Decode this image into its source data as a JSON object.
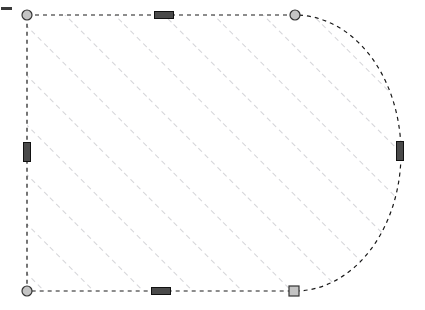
{
  "canvas": {
    "width": 425,
    "height": 310,
    "background_color": "#ffffff",
    "label": "drawing-canvas"
  },
  "shape": {
    "name": "hatched-rounded-end-rectangle",
    "description": "Rectangle with semicircular right end, selected",
    "state": "selected",
    "outline": {
      "color": "#1a1a1a",
      "style": "dashed",
      "dash_pattern": "4 4",
      "width": 1.2
    },
    "geometry": {
      "left_x": 27,
      "right_x": 295,
      "top_y": 15,
      "bottom_y": 291,
      "arc_peak_x": 401,
      "arc_center_y": 153
    },
    "fill": {
      "type": "hatch",
      "pattern": "diagonal-dashed-45",
      "color": "#a8a8b0",
      "spacing": 35,
      "angle_degrees": 45,
      "dash_pattern": "5 4",
      "width": 1
    }
  },
  "handles": {
    "corner_grips": [
      {
        "name": "grip-top-left",
        "shape": "circle",
        "x": 27,
        "y": 15
      },
      {
        "name": "grip-top-right",
        "shape": "circle",
        "x": 295,
        "y": 15
      },
      {
        "name": "grip-bottom-left",
        "shape": "circle",
        "x": 27,
        "y": 291
      },
      {
        "name": "grip-bottom-right",
        "shape": "square",
        "x": 294,
        "y": 291
      }
    ],
    "grip_style": {
      "fill_color": "#c4c4c4",
      "border_color": "#333333",
      "radius": 5,
      "square_size": 10
    },
    "edge_grips": [
      {
        "name": "grip-top-mid",
        "orientation": "horizontal",
        "x": 164,
        "y": 15
      },
      {
        "name": "grip-bottom-mid",
        "orientation": "horizontal",
        "x": 161,
        "y": 291
      },
      {
        "name": "grip-left-mid",
        "orientation": "vertical",
        "x": 27,
        "y": 152
      },
      {
        "name": "grip-arc-mid",
        "orientation": "vertical",
        "x": 400,
        "y": 151
      }
    ],
    "edge_grip_style": {
      "fill_color": "#4a4a4a",
      "border_color": "#111111",
      "long_side": 19,
      "short_side": 7
    }
  },
  "markers": {
    "left_tick": {
      "name": "left-edge-tick",
      "x": 1,
      "y": 7,
      "width": 11,
      "height": 3,
      "color": "#3a3a3a"
    }
  }
}
